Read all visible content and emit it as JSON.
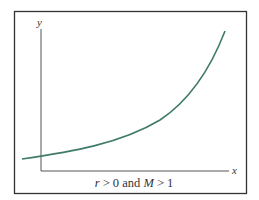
{
  "diagram": {
    "type": "exponential-growth-curve",
    "axes": {
      "x_label": "x",
      "y_label": "y"
    },
    "caption": {
      "var1": "r",
      "rel1": " > 0 and ",
      "var2": "M",
      "rel2": " > 1"
    },
    "colors": {
      "frame": "#333333",
      "axis": "#555555",
      "curve": "#3f7a6a",
      "background": "#ffffff"
    }
  }
}
